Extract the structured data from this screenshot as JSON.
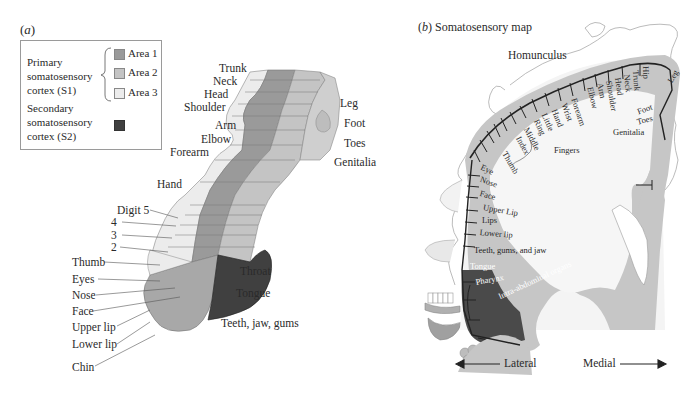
{
  "colors": {
    "area1": "#9a9a9a",
    "area2": "#c4c4c4",
    "area3": "#ececec",
    "s2": "#404040",
    "cortex": "#c8c8c8",
    "text": "#2a2a2a"
  },
  "panel_a": {
    "label_letter": "a",
    "legend": {
      "primary_label": [
        "Primary",
        "somatosensory",
        "cortex (S1)"
      ],
      "areas": [
        {
          "label": "Area 1",
          "color": "#9a9a9a"
        },
        {
          "label": "Area 2",
          "color": "#c4c4c4"
        },
        {
          "label": "Area 3",
          "color": "#ececec"
        }
      ],
      "secondary_label": [
        "Secondary",
        "somatosensory",
        "cortex (S2)"
      ],
      "secondary_color": "#404040"
    },
    "labels_left_upper": [
      "Trunk",
      "Neck",
      "Head",
      "Shoulder",
      "Arm",
      "Elbow",
      "Forearm",
      "Hand"
    ],
    "labels_digits": [
      "Digit 5",
      "4",
      "3",
      "2",
      "Thumb"
    ],
    "labels_face": [
      "Eyes",
      "Nose",
      "Face",
      "Upper lip",
      "Lower lip",
      "Chin"
    ],
    "labels_right": [
      "Leg",
      "Foot",
      "Toes",
      "Genitalia"
    ],
    "labels_s2": [
      "Throat",
      "Tongue",
      "Teeth, jaw, gums"
    ]
  },
  "panel_b": {
    "label_letter": "b",
    "title": "Somatosensory map",
    "homunculus_label": "Homunculus",
    "body_parts_arc": [
      "Thumb",
      "Index",
      "Middle",
      "Ring",
      "Little",
      "Hand",
      "Wrist",
      "Forearm",
      "Elbow",
      "Arm",
      "Shoulder",
      "Head",
      "Neck",
      "Trunk",
      "Hip",
      "Leg",
      "Foot",
      "Toes"
    ],
    "fingers_label": "Fingers",
    "genitalia_label": "Genitalia",
    "face_parts": [
      "Eye",
      "Nose",
      "Face",
      "Upper Lip",
      "Lips",
      "Lower lip"
    ],
    "mouth_parts": [
      "Teeth, gums, and jaw",
      "Tongue",
      "Pharynx",
      "Intra-abdominal organs"
    ],
    "axis": {
      "left": "Lateral",
      "right": "Medial"
    }
  }
}
